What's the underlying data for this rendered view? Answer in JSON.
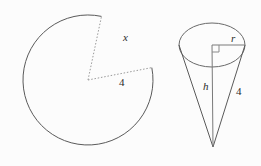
{
  "figure": {
    "background_color": "#fcfcfc",
    "stroke_color": "#555555",
    "light_stroke_color": "#aaaaaa",
    "text_color": "#2b2b2b"
  },
  "circle_figure": {
    "name": "circle-with-sector-removed",
    "arc_label": "x",
    "radius_label": "4",
    "center": {
      "x": 88,
      "y": 80
    },
    "radius_px": 65,
    "cut_start_angle_deg": -78,
    "cut_end_angle_deg": -11
  },
  "cone_figure": {
    "name": "cone-with-dimensions",
    "radius_label": "r",
    "height_label": "h",
    "slant_label": "4",
    "apex": {
      "x": 213,
      "y": 147
    },
    "ellipse_center": {
      "x": 212,
      "y": 45
    },
    "ellipse_rx": 33,
    "ellipse_ry": 22
  }
}
